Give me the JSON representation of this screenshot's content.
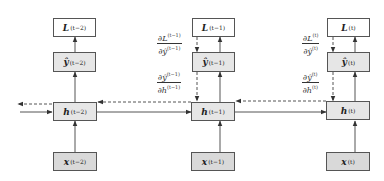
{
  "diagram": {
    "timesteps": [
      {
        "id": "t-2",
        "loss": {
          "symbol": "L",
          "sup": "(t−2)"
        },
        "output": {
          "symbol": "ŷ",
          "sup": "(t−2)"
        },
        "hidden": {
          "symbol": "h",
          "sup": "(t−2)"
        },
        "input": {
          "symbol": "x",
          "sup": "(t−2)"
        }
      },
      {
        "id": "t-1",
        "loss": {
          "symbol": "L",
          "sup": "(t−1)"
        },
        "output": {
          "symbol": "ŷ",
          "sup": "(t−1)"
        },
        "hidden": {
          "symbol": "h",
          "sup": "(t−1)"
        },
        "input": {
          "symbol": "x",
          "sup": "(t−1)"
        },
        "grad_loss_output": {
          "num": "∂L",
          "num_sup": "(t−1)",
          "den": "∂ŷ",
          "den_sup": "(t−1)"
        },
        "grad_output_hidden": {
          "num": "∂ŷ",
          "num_sup": "(t−1)",
          "den": "∂h",
          "den_sup": "(t−1)"
        }
      },
      {
        "id": "t",
        "loss": {
          "symbol": "L",
          "sup": "(t)"
        },
        "output": {
          "symbol": "ŷ",
          "sup": "(t)"
        },
        "hidden": {
          "symbol": "h",
          "sup": "(t)"
        },
        "input": {
          "symbol": "x",
          "sup": "(t)"
        },
        "grad_loss_output": {
          "num": "∂L",
          "num_sup": "(t)",
          "den": "∂ŷ",
          "den_sup": "(t)"
        },
        "grad_output_hidden": {
          "num": "∂ŷ",
          "num_sup": "(t)",
          "den": "∂h",
          "den_sup": "(t)"
        }
      }
    ],
    "legend": {
      "solid_arrow": "forward pass",
      "dashed_arrow": "backward pass (gradient)"
    },
    "colors": {
      "loss_box": "#ffffff",
      "output_box": "#e6e6e6",
      "hidden_box": "#e6e6e6",
      "input_box": "#d9d9d9",
      "stroke": "#555555"
    }
  }
}
